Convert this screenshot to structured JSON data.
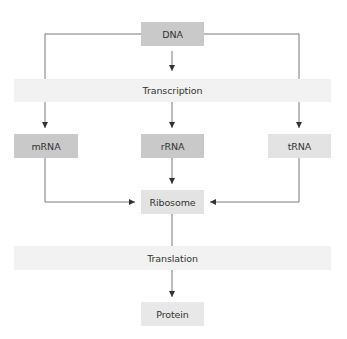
{
  "diagram": {
    "title": "",
    "nodes": {
      "dna": "DNA",
      "transcription": "Transcription",
      "mrna": "mRNA",
      "rrna": "rRNA",
      "trna": "tRNA",
      "ribosome": "Ribosome",
      "translation": "Translation",
      "protein": "Protein"
    },
    "edges": [
      {
        "from": "DNA",
        "to": "Transcription"
      },
      {
        "from": "DNA",
        "to": "mRNA",
        "via": "left branch through Transcription"
      },
      {
        "from": "DNA",
        "to": "tRNA",
        "via": "right branch through Transcription"
      },
      {
        "from": "Transcription",
        "to": "rRNA"
      },
      {
        "from": "mRNA",
        "to": "Ribosome"
      },
      {
        "from": "rRNA",
        "to": "Ribosome"
      },
      {
        "from": "tRNA",
        "to": "Ribosome"
      },
      {
        "from": "Ribosome",
        "to": "Translation"
      },
      {
        "from": "Translation",
        "to": "Protein"
      }
    ],
    "colors": {
      "dna_box": "#c9c9c9",
      "mrna_box": "#c9c9c9",
      "rrna_box": "#c9c9c9",
      "trna_box": "#e3e3e3",
      "ribosome_box": "#e3e3e3",
      "protein_box": "#e8e8e8",
      "band": "#f2f2f2",
      "line": "#444444"
    }
  }
}
